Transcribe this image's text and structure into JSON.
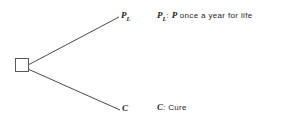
{
  "diagram": {
    "type": "decision-tree",
    "title": "",
    "decision_node": {
      "shape": "square",
      "x": 15,
      "y": 58,
      "size": 14,
      "stroke_color": "#5a5a5a",
      "fill_color": "#ffffff"
    },
    "line_color": "#4a4a4a",
    "branches": [
      {
        "id": "branch-upper",
        "label_symbol": "P",
        "label_subscript": "L",
        "from": {
          "x": 29,
          "y": 64
        },
        "to": {
          "x": 118,
          "y": 17
        }
      },
      {
        "id": "branch-lower",
        "label_symbol": "C",
        "label_subscript": "",
        "from": {
          "x": 29,
          "y": 70
        },
        "to": {
          "x": 119,
          "y": 110
        }
      }
    ],
    "legend": [
      {
        "id": "legend-pl",
        "key_symbol": "P",
        "key_subscript": "L",
        "separator": ":",
        "value_italic": "P",
        "value_text": "once a year for life"
      },
      {
        "id": "legend-c",
        "key_symbol": "C",
        "key_subscript": "",
        "separator": ":",
        "value_italic": "",
        "value_text": "Cure"
      }
    ]
  }
}
